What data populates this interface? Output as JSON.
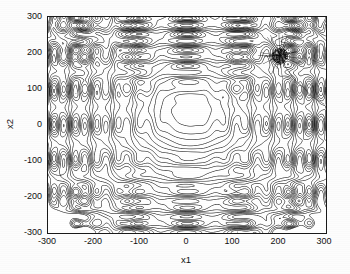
{
  "figure": {
    "kind": "contour-plot",
    "background_color": "#ffffff",
    "line_color": "#1a1a1a",
    "frame_color": "#1a1a1a"
  },
  "chart_data": {
    "type": "contour",
    "title": "",
    "xlabel": "x1",
    "ylabel": "x2",
    "xlim": [
      -300,
      300
    ],
    "ylim": [
      -300,
      300
    ],
    "xticks": [
      -300,
      -200,
      -100,
      0,
      100,
      200,
      300
    ],
    "yticks": [
      -300,
      -200,
      -100,
      0,
      100,
      200,
      300
    ],
    "xtick_labels": [
      "-300",
      "-200",
      "-100",
      "0",
      "100",
      "200",
      "300"
    ],
    "ytick_labels": [
      "-300",
      "-200",
      "-100",
      "0",
      "100",
      "200",
      "300"
    ],
    "grid": false,
    "legend": null,
    "colormap": "grayscale",
    "surface_model": {
      "form": "schwefel-like-multimodal",
      "basin_center": [
        10,
        40
      ],
      "basin_radius": 150,
      "ripple_amplitude": 34,
      "ripple_wavelength_x": 46,
      "ripple_wavelength_y": 44
    },
    "contour_levels": [
      20,
      45,
      70,
      95,
      120,
      150,
      180,
      215,
      250,
      290,
      330,
      375,
      420,
      470,
      520,
      575,
      630,
      690,
      750,
      815,
      880,
      950,
      1020,
      1100,
      1180,
      1265,
      1350,
      1440,
      1535,
      1630
    ],
    "annotations": [
      {
        "name": "search-cluster",
        "type": "point-cloud",
        "x": 200,
        "y": 193,
        "spread": 17,
        "n_points": 420,
        "color": "#0d0d0d",
        "note": "dense converged cluster of search points"
      },
      {
        "name": "search-trajectory",
        "type": "polyline",
        "color": "#2a2a2a",
        "points": [
          [
            296,
            58
          ],
          [
            268,
            80
          ],
          [
            252,
            104
          ],
          [
            235,
            122
          ],
          [
            224,
            140
          ],
          [
            214,
            158
          ],
          [
            206,
            176
          ],
          [
            201,
            190
          ]
        ],
        "note": "path of the optimiser approaching the cluster"
      }
    ]
  }
}
